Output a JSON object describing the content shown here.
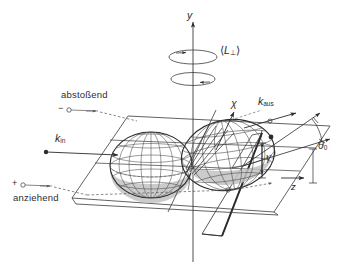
{
  "figure": {
    "background_color": "#ffffff",
    "ink_color": "#2b2b2b",
    "shade_color": "#b9b9b9",
    "width": 357,
    "height": 267
  },
  "axes": {
    "vertical_label": "y",
    "depth_label": "z"
  },
  "angular_momentum": {
    "label_open": "⟨",
    "label_symbol": "L",
    "label_subscript": "⊥",
    "label_close": "⟩",
    "upper_ring_sign": "+",
    "lower_ring_sign": "−"
  },
  "vectors": {
    "k_in": {
      "symbol": "k",
      "subscript": "in"
    },
    "k_out": {
      "symbol": "k",
      "subscript": "aus"
    }
  },
  "angles": {
    "chi": "χ",
    "gamma": "γ",
    "theta": "θ",
    "theta_subscript": "0"
  },
  "interaction_labels": {
    "repulsive": {
      "text": "abstoßend",
      "sign": "−"
    },
    "attractive": {
      "text": "anziehend",
      "sign": "+"
    }
  }
}
